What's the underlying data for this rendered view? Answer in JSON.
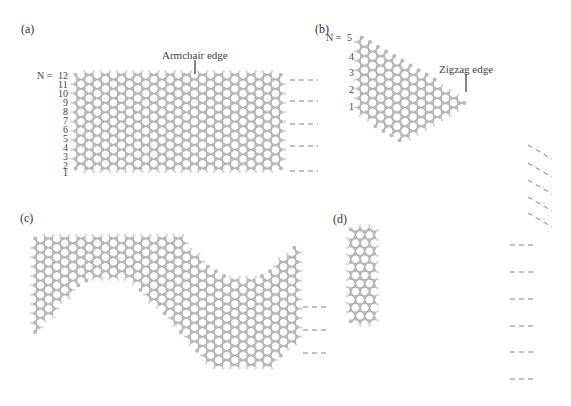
{
  "figure": {
    "panels": [
      {
        "id": "a",
        "label": "(a)",
        "edge_label": "Armchair edge",
        "n_label_prefix": "N = ",
        "n_labels": [
          "12",
          "11",
          "10",
          "9",
          "8",
          "7",
          "6",
          "5",
          "4",
          "3",
          "2",
          "1"
        ]
      },
      {
        "id": "b",
        "label": "(b)",
        "edge_label": "Zigzag edge",
        "n_label_prefix": "N = ",
        "n_labels": [
          "5",
          "4",
          "3",
          "2",
          "1"
        ]
      },
      {
        "id": "c",
        "label": "(c)"
      },
      {
        "id": "d",
        "label": "(d)"
      }
    ],
    "colors": {
      "carbon": "#b8b8b8",
      "bond": "#a9a9a9",
      "hydrogen": "#d8d8d8",
      "text": "#333333",
      "dash": "#666666"
    }
  }
}
